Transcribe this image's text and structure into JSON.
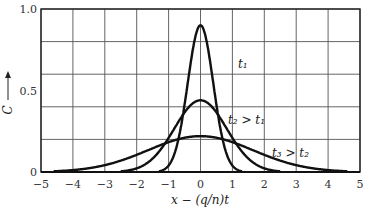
{
  "chart_data": {
    "type": "line",
    "title": "",
    "xlabel": "x − (q/n)t",
    "ylabel": "C",
    "xlim": [
      -5,
      5
    ],
    "ylim": [
      0,
      1.0
    ],
    "x_ticks": [
      "−5",
      "−4",
      "−3",
      "−2",
      "−1",
      "0",
      "1",
      "2",
      "3",
      "4",
      "5"
    ],
    "y_ticks": [
      "0",
      "0.5",
      "1.0"
    ],
    "grid": true,
    "series": [
      {
        "name": "t1",
        "label": "t₁",
        "shape": "gaussian",
        "peak": 0.9,
        "sigma": 0.4,
        "center": 0
      },
      {
        "name": "t2",
        "label": "t₂ > t₁",
        "shape": "gaussian",
        "peak": 0.44,
        "sigma": 0.82,
        "center": 0
      },
      {
        "name": "t3",
        "label": "t₃ > t₂",
        "shape": "gaussian",
        "peak": 0.22,
        "sigma": 1.65,
        "center": 0
      }
    ]
  }
}
